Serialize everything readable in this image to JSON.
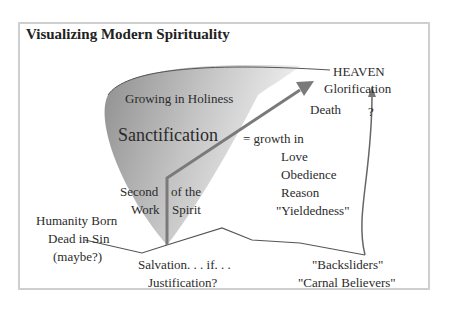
{
  "title": "Visualizing Modern Spirituality",
  "labels": {
    "heaven": "HEAVEN",
    "glorification": "Glorification",
    "death": "Death",
    "question": "?",
    "growing": "Growing in Holiness",
    "sanctification": "Sanctification",
    "growth_in": "= growth in",
    "love": "Love",
    "obedience": "Obedience",
    "reason": "Reason",
    "yieldedness": "\"Yieldedness\"",
    "second": "Second",
    "work": "Work",
    "of_the": "of the",
    "spirit": "Spirit",
    "humanity1": "Humanity Born",
    "humanity2": "Dead in Sin",
    "humanity3": "(maybe?)",
    "salvation": "Salvation. . . if. . .",
    "justification": "Justification?",
    "backsliders": "\"Backsliders\"",
    "carnal": "\"Carnal Believers\""
  }
}
